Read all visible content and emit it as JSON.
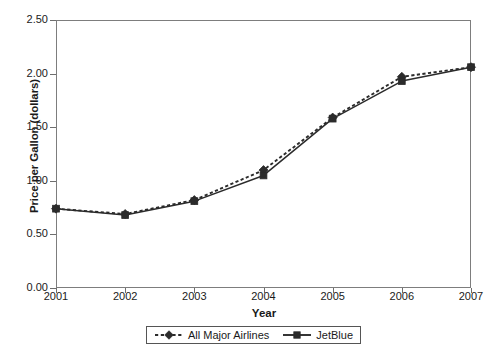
{
  "chart_data": {
    "type": "line",
    "title": "",
    "xlabel": "Year",
    "ylabel": "Price per Gallon (dollars)",
    "categories": [
      "2001",
      "2002",
      "2003",
      "2004",
      "2005",
      "2006",
      "2007"
    ],
    "x": [
      2001,
      2002,
      2003,
      2004,
      2005,
      2006,
      2007
    ],
    "xlim": [
      2001,
      2007
    ],
    "ylim": [
      0.0,
      2.5
    ],
    "yticks": [
      "0.00",
      "0.50",
      "1.00",
      "1.50",
      "2.00",
      "2.50"
    ],
    "ytick_values": [
      0.0,
      0.5,
      1.0,
      1.5,
      2.0,
      2.5
    ],
    "grid": false,
    "legend_position": "bottom",
    "series": [
      {
        "name": "All Major Airlines",
        "values": [
          0.74,
          0.69,
          0.82,
          1.1,
          1.59,
          1.97,
          2.06
        ],
        "line_style": "dashed",
        "marker": "diamond",
        "color": "#2b2b2b"
      },
      {
        "name": "JetBlue",
        "values": [
          0.74,
          0.68,
          0.81,
          1.05,
          1.58,
          1.93,
          2.06
        ],
        "line_style": "solid",
        "marker": "square",
        "color": "#2b2b2b"
      }
    ]
  },
  "axis": {
    "x_title": "Year",
    "y_title": "Price per Gallon (dollars)"
  },
  "legend": {
    "entries": [
      {
        "label": "All Major Airlines",
        "marker": "diamond-marker",
        "style": "dashed"
      },
      {
        "label": "JetBlue",
        "marker": "square-marker",
        "style": "solid"
      }
    ]
  },
  "colors": {
    "series": "#2b2b2b",
    "axis": "#7d7d7d",
    "text": "#1a1a1a"
  }
}
